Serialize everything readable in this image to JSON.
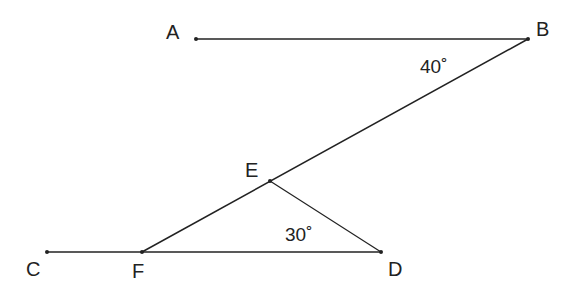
{
  "points": {
    "A": {
      "label": "A",
      "x": 196,
      "y": 39
    },
    "B": {
      "label": "B",
      "x": 528,
      "y": 39
    },
    "C": {
      "label": "C",
      "x": 47,
      "y": 252
    },
    "D": {
      "label": "D",
      "x": 381,
      "y": 252
    },
    "E": {
      "label": "E",
      "x": 270,
      "y": 181
    },
    "F": {
      "label": "F",
      "x": 142,
      "y": 252
    }
  },
  "segments": [
    "AB",
    "CD",
    "BF",
    "ED"
  ],
  "angles": {
    "B": {
      "label": "40˚"
    },
    "D": {
      "label": "30˚"
    }
  },
  "colors": {
    "line": "#222222",
    "background": "#ffffff"
  }
}
